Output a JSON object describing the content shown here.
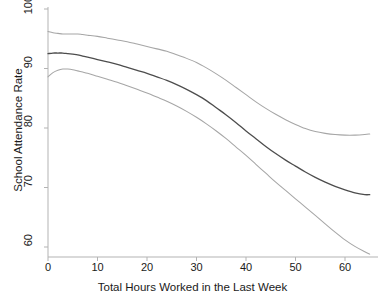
{
  "chart_data": {
    "type": "line",
    "title": "",
    "xlabel": "Total Hours Worked in the Last Week",
    "ylabel": "School Attendance Rate",
    "xlim": [
      -1,
      66
    ],
    "ylim": [
      58,
      101
    ],
    "grid": false,
    "legend": "none",
    "xticks": [
      0,
      10,
      20,
      30,
      40,
      50,
      60
    ],
    "xtick_labels": [
      "0",
      "10",
      "20",
      "30",
      "40",
      "50",
      "60"
    ],
    "yticks": [
      60,
      70,
      80,
      90,
      100
    ],
    "ytick_labels": [
      "60",
      "70",
      "80",
      "90",
      "100"
    ],
    "colors": {
      "estimate": "#4d4d4d",
      "confidence_band": "#a6a6a6",
      "axis": "#b3b3b3",
      "text": "#1a1a1a"
    },
    "series": [
      {
        "name": "Upper 95% confidence limit",
        "color": "#a6a6a6",
        "x": [
          0,
          1,
          2,
          3,
          4,
          5,
          6,
          7,
          8,
          10,
          12,
          14,
          16,
          18,
          20,
          22,
          24,
          26,
          28,
          30,
          32,
          34,
          36,
          38,
          40,
          42,
          44,
          46,
          48,
          50,
          52,
          54,
          56,
          58,
          60,
          62,
          64,
          65
        ],
        "values": [
          96.2,
          96.0,
          95.9,
          95.8,
          95.8,
          95.8,
          95.8,
          95.7,
          95.6,
          95.4,
          95.1,
          94.8,
          94.5,
          94.1,
          93.7,
          93.3,
          92.9,
          92.3,
          91.7,
          91.0,
          90.1,
          89.1,
          88.0,
          86.8,
          85.6,
          84.4,
          83.3,
          82.3,
          81.4,
          80.6,
          79.9,
          79.4,
          79.1,
          78.9,
          78.8,
          78.8,
          78.9,
          79.0
        ]
      },
      {
        "name": "Predicted attendance rate",
        "color": "#4d4d4d",
        "x": [
          0,
          1,
          2,
          3,
          4,
          5,
          6,
          7,
          8,
          10,
          12,
          14,
          16,
          18,
          20,
          22,
          24,
          26,
          28,
          30,
          32,
          34,
          36,
          38,
          40,
          42,
          44,
          46,
          48,
          50,
          52,
          54,
          56,
          58,
          60,
          62,
          64,
          65
        ],
        "values": [
          92.5,
          92.6,
          92.6,
          92.6,
          92.5,
          92.4,
          92.3,
          92.1,
          91.9,
          91.5,
          91.1,
          90.7,
          90.2,
          89.7,
          89.2,
          88.6,
          88.0,
          87.3,
          86.5,
          85.6,
          84.6,
          83.4,
          82.2,
          80.9,
          79.5,
          78.2,
          76.9,
          75.7,
          74.6,
          73.6,
          72.6,
          71.7,
          70.9,
          70.2,
          69.6,
          69.1,
          68.8,
          68.8
        ]
      },
      {
        "name": "Lower 95% confidence limit",
        "color": "#a6a6a6",
        "x": [
          0,
          1,
          2,
          3,
          4,
          5,
          6,
          7,
          8,
          10,
          12,
          14,
          16,
          18,
          20,
          22,
          24,
          26,
          28,
          30,
          32,
          34,
          36,
          38,
          40,
          42,
          44,
          46,
          48,
          50,
          52,
          54,
          56,
          58,
          60,
          62,
          64,
          65
        ],
        "values": [
          88.6,
          89.3,
          89.7,
          89.9,
          89.9,
          89.8,
          89.6,
          89.4,
          89.2,
          88.7,
          88.2,
          87.7,
          87.1,
          86.5,
          85.9,
          85.2,
          84.5,
          83.7,
          82.8,
          81.8,
          80.7,
          79.5,
          78.2,
          76.8,
          75.4,
          73.9,
          72.4,
          70.9,
          69.5,
          68.1,
          66.7,
          65.3,
          63.9,
          62.5,
          61.2,
          60.1,
          59.2,
          58.8
        ]
      }
    ]
  },
  "axes": {
    "x_title": "Total Hours Worked in the Last Week",
    "y_title": "School Attendance Rate"
  }
}
